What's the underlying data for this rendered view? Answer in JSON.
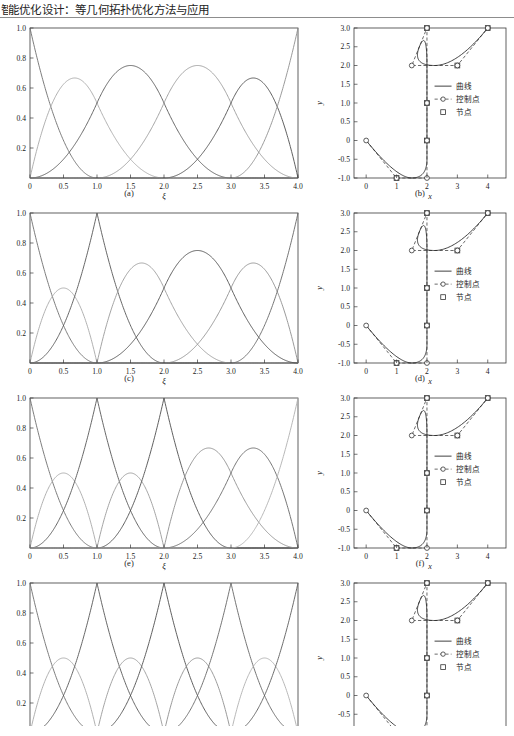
{
  "header": {
    "title": "能优化设计：等几何拓扑优化方法与应用",
    "first_char_clipped": "智"
  },
  "figure": {
    "captions": [
      "(a)",
      "(b)",
      "(c)",
      "(d)",
      "(e)",
      "(f)",
      "(g)",
      "(h)"
    ],
    "legend": {
      "curve": "曲线",
      "control_points": "控制点",
      "knots": "节点"
    },
    "axes": {
      "basis_xlabel": "ξ",
      "basis_ylabel": "",
      "curve_xlabel": "x",
      "curve_ylabel": "y",
      "basis_xticks": [
        "0",
        "0.5",
        "1.0",
        "1.5",
        "2.0",
        "2.5",
        "3.0",
        "3.5",
        "4.0"
      ],
      "basis_yticks": [
        "0.2",
        "0.4",
        "0.6",
        "0.8",
        "1.0"
      ],
      "curve_xticks": [
        "0",
        "1",
        "2",
        "3",
        "4"
      ],
      "curve_yticks": [
        "-1.0",
        "-0.5",
        "0",
        "0.5",
        "1.0",
        "1.5",
        "2.0",
        "2.5",
        "3.0"
      ]
    }
  },
  "chart_data": [
    {
      "type": "line",
      "panel": "(a)",
      "title": "Quadratic B-spline basis functions, knot vector {0,0,0,1,2,3,4,4,4}",
      "xlabel": "ξ",
      "ylabel": "",
      "xlim": [
        0,
        4
      ],
      "ylim": [
        0,
        1
      ],
      "grid": false,
      "knot_vector": [
        0,
        0,
        0,
        1,
        2,
        3,
        4,
        4,
        4
      ],
      "degree": 2,
      "n_basis": 6,
      "peaks": [
        {
          "xi": 0.0,
          "value": 1.0
        },
        {
          "xi": 0.65,
          "value": 0.67
        },
        {
          "xi": 1.5,
          "value": 0.75
        },
        {
          "xi": 2.5,
          "value": 0.75
        },
        {
          "xi": 3.33,
          "value": 0.67
        },
        {
          "xi": 4.0,
          "value": 1.0
        }
      ]
    },
    {
      "type": "line",
      "panel": "(b)",
      "title": "B-spline curve with control polygon and knots",
      "xlabel": "x",
      "ylabel": "y",
      "xlim": [
        -0.4,
        4.6
      ],
      "ylim": [
        -1.0,
        3.0
      ],
      "grid": false,
      "control_points": [
        [
          0,
          0
        ],
        [
          1,
          -1
        ],
        [
          2,
          -1
        ],
        [
          2,
          0
        ],
        [
          2,
          1
        ],
        [
          2,
          3
        ],
        [
          1.5,
          2
        ],
        [
          3,
          2
        ],
        [
          4,
          3
        ]
      ],
      "knots_on_curve": [
        [
          1,
          -1
        ],
        [
          2,
          0
        ],
        [
          2,
          1
        ],
        [
          2,
          3
        ],
        [
          3,
          2
        ],
        [
          4,
          3
        ]
      ],
      "legend": [
        "曲线",
        "控制点",
        "节点"
      ]
    },
    {
      "type": "line",
      "panel": "(c)",
      "title": "Basis functions after knot insertion at ξ = 1",
      "xlabel": "ξ",
      "ylabel": "",
      "xlim": [
        0,
        4
      ],
      "ylim": [
        0,
        1
      ],
      "grid": false,
      "knot_vector": [
        0,
        0,
        0,
        1,
        1,
        2,
        3,
        4,
        4,
        4
      ],
      "degree": 2,
      "n_basis": 7,
      "peaks": [
        {
          "xi": 0.0,
          "value": 1.0
        },
        {
          "xi": 0.5,
          "value": 0.5
        },
        {
          "xi": 1.0,
          "value": 1.0
        },
        {
          "xi": 1.67,
          "value": 0.67
        },
        {
          "xi": 2.5,
          "value": 0.75
        },
        {
          "xi": 3.33,
          "value": 0.67
        },
        {
          "xi": 4.0,
          "value": 1.0
        }
      ]
    },
    {
      "type": "line",
      "panel": "(d)",
      "title": "Curve after knot insertion at ξ = 1",
      "xlabel": "x",
      "ylabel": "y",
      "xlim": [
        -0.4,
        4.6
      ],
      "ylim": [
        -1.0,
        3.0
      ],
      "grid": false,
      "control_points": [
        [
          0,
          0
        ],
        [
          1,
          -1
        ],
        [
          2,
          -1
        ],
        [
          2,
          0
        ],
        [
          2,
          1
        ],
        [
          2,
          3
        ],
        [
          1.5,
          2
        ],
        [
          3,
          2
        ],
        [
          4,
          3
        ]
      ],
      "knots_on_curve": [
        [
          1,
          -1
        ],
        [
          2,
          0
        ],
        [
          2,
          1
        ],
        [
          2,
          3
        ],
        [
          3,
          2
        ],
        [
          4,
          3
        ]
      ],
      "legend": [
        "曲线",
        "控制点",
        "节点"
      ]
    },
    {
      "type": "line",
      "panel": "(e)",
      "title": "Basis functions after knot insertion at ξ = 1 and 2",
      "xlabel": "ξ",
      "ylabel": "",
      "xlim": [
        0,
        4
      ],
      "ylim": [
        0,
        1
      ],
      "grid": false,
      "knot_vector": [
        0,
        0,
        0,
        1,
        1,
        2,
        2,
        3,
        4,
        4,
        4
      ],
      "degree": 2,
      "n_basis": 8,
      "peaks": [
        {
          "xi": 0.0,
          "value": 1.0
        },
        {
          "xi": 0.5,
          "value": 0.5
        },
        {
          "xi": 1.0,
          "value": 1.0
        },
        {
          "xi": 1.5,
          "value": 0.5
        },
        {
          "xi": 2.0,
          "value": 1.0
        },
        {
          "xi": 2.67,
          "value": 0.67
        },
        {
          "xi": 3.33,
          "value": 0.67
        },
        {
          "xi": 4.0,
          "value": 1.0
        }
      ]
    },
    {
      "type": "line",
      "panel": "(f)",
      "title": "Curve after knot insertion at ξ = 1 and 2",
      "xlabel": "x",
      "ylabel": "y",
      "xlim": [
        -0.4,
        4.6
      ],
      "ylim": [
        -1.0,
        3.0
      ],
      "grid": false,
      "control_points": [
        [
          0,
          0
        ],
        [
          1,
          -1
        ],
        [
          2,
          -1
        ],
        [
          2,
          0
        ],
        [
          2,
          1
        ],
        [
          2,
          3
        ],
        [
          1.5,
          2
        ],
        [
          3,
          2
        ],
        [
          4,
          3
        ]
      ],
      "knots_on_curve": [
        [
          1,
          -1
        ],
        [
          2,
          0
        ],
        [
          2,
          1
        ],
        [
          2,
          3
        ],
        [
          3,
          2
        ],
        [
          4,
          3
        ]
      ],
      "legend": [
        "曲线",
        "控制点",
        "节点"
      ]
    },
    {
      "type": "line",
      "panel": "(g)",
      "title": "Basis functions after knot insertion at ξ = 1, 2 and 3",
      "xlabel": "ξ",
      "ylabel": "",
      "xlim": [
        0,
        4
      ],
      "ylim": [
        0,
        1
      ],
      "grid": false,
      "knot_vector": [
        0,
        0,
        0,
        1,
        1,
        2,
        2,
        3,
        3,
        4,
        4,
        4
      ],
      "degree": 2,
      "n_basis": 9,
      "peaks": [
        {
          "xi": 0.0,
          "value": 1.0
        },
        {
          "xi": 0.5,
          "value": 0.5
        },
        {
          "xi": 1.0,
          "value": 1.0
        },
        {
          "xi": 1.5,
          "value": 0.5
        },
        {
          "xi": 2.0,
          "value": 1.0
        },
        {
          "xi": 2.5,
          "value": 0.5
        },
        {
          "xi": 3.0,
          "value": 1.0
        },
        {
          "xi": 3.5,
          "value": 0.5
        },
        {
          "xi": 4.0,
          "value": 1.0
        }
      ],
      "note": "panel cropped at page bottom"
    },
    {
      "type": "line",
      "panel": "(h)",
      "title": "Curve after knot insertion at ξ = 1, 2 and 3",
      "xlabel": "x",
      "ylabel": "y",
      "xlim": [
        -0.4,
        4.6
      ],
      "ylim": [
        -1.0,
        3.0
      ],
      "grid": false,
      "control_points": [
        [
          0,
          0
        ],
        [
          1,
          -1
        ],
        [
          2,
          -1
        ],
        [
          2,
          0
        ],
        [
          2,
          1
        ],
        [
          2,
          3
        ],
        [
          1.5,
          2
        ],
        [
          3,
          2
        ],
        [
          4,
          3
        ]
      ],
      "knots_on_curve": [
        [
          1,
          -1
        ],
        [
          2,
          0
        ],
        [
          2,
          1
        ],
        [
          2,
          3
        ],
        [
          3,
          2
        ],
        [
          4,
          3
        ]
      ],
      "legend": [
        "曲线",
        "控制点",
        "节点"
      ],
      "note": "panel cropped at page bottom"
    }
  ]
}
